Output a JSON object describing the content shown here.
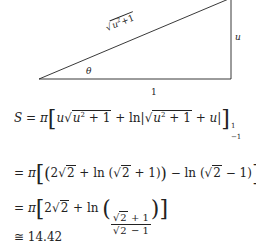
{
  "figure": {
    "hypotenuse_label": "√u²+1",
    "hyp_rad": "u",
    "hyp_sup": "2",
    "hyp_tail": "+1",
    "vertical_label": "u",
    "angle_label": "θ",
    "base_label": "1"
  },
  "equations": [
    {
      "id": "S-def",
      "text": "S = π[u√(u² + 1) + ln|√(u² + 1) + u|] from −1 to 1"
    },
    {
      "id": "step1",
      "text": "= π[(2√2 + ln(√2 + 1)) − ln(√2 − 1)]"
    },
    {
      "id": "step2",
      "text": "= π[2√2 + ln((√2 + 1)/(√2 − 1))]"
    },
    {
      "id": "result",
      "text": "≅ 14.42"
    }
  ],
  "eq": {
    "S": "S",
    "eq": " = ",
    "pi": "π",
    "u": "u",
    "sq": "√",
    "u2": "u",
    "two": "2",
    "plus1": " + 1",
    "plus": " + ",
    "ln": "ln",
    "bar": "|",
    "plus_u": " + u",
    "upper": "1",
    "lower": "−1",
    "s1_a": "2√",
    "s1_b": "2",
    "s1_c": " + ln (√",
    "s1_d": "2",
    "s1_e": " + 1)",
    "s1_f": " − ln (√",
    "s1_g": "2",
    "s1_h": " − 1)",
    "s2_a": "2√",
    "s2_b": "2",
    "s2_c": " + ln ",
    "s2_num_a": "√",
    "s2_num_b": "2",
    "s2_num_c": " + 1",
    "s2_den_a": "√",
    "s2_den_b": "2",
    "s2_den_c": " − 1",
    "approx": "≅ 14.42",
    "lbr": "[",
    "rbr": "]",
    "lp": "(",
    "rp": ")"
  }
}
